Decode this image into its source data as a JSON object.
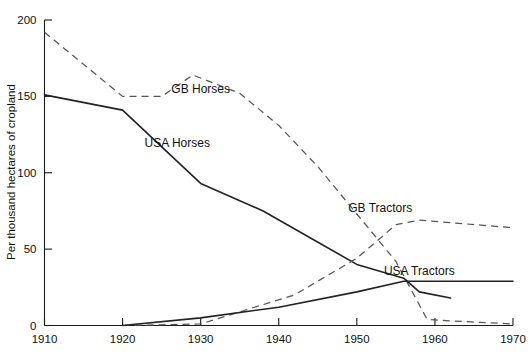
{
  "chart_data": {
    "type": "line",
    "title": "",
    "xlabel": "",
    "ylabel": "Per thousand hectares of cropland",
    "xlim": [
      1910,
      1970
    ],
    "ylim": [
      0,
      200
    ],
    "grid": false,
    "legend_position": "inline-annotations",
    "xticks": [
      1910,
      1920,
      1930,
      1940,
      1950,
      1960,
      1970
    ],
    "xticklabels": [
      "1910",
      "1920",
      "1930",
      "1940",
      "1950",
      "1960",
      "1970"
    ],
    "yticks": [
      0,
      50,
      100,
      150,
      200
    ],
    "yticklabels": [
      "0",
      "50",
      "100",
      "150",
      "200"
    ],
    "series": [
      {
        "name": "GB Horses",
        "style": "dashed",
        "label_x": 1930,
        "label_y": 152,
        "x": [
          1910,
          1920,
          1925,
          1929,
          1935,
          1940,
          1945,
          1950,
          1955,
          1959,
          1962,
          1970
        ],
        "values": [
          192,
          150,
          150,
          164,
          152,
          131,
          104,
          73,
          42,
          4,
          3,
          1
        ]
      },
      {
        "name": "USA Horses",
        "style": "solid",
        "label_x": 1927,
        "label_y": 117,
        "x": [
          1910,
          1920,
          1930,
          1938,
          1950,
          1956,
          1958,
          1962
        ],
        "values": [
          151,
          141,
          93,
          75,
          40,
          31,
          22,
          18
        ]
      },
      {
        "name": "GB Tractors",
        "style": "dashed",
        "label_x": 1953,
        "label_y": 74,
        "x": [
          1920,
          1930,
          1942,
          1950,
          1955,
          1958,
          1970
        ],
        "values": [
          0,
          1,
          20,
          44,
          66,
          69,
          64
        ]
      },
      {
        "name": "USA Tractors",
        "style": "solid",
        "label_x": 1958,
        "label_y": 33,
        "x": [
          1920,
          1930,
          1940,
          1950,
          1956,
          1962,
          1970
        ],
        "values": [
          0,
          5,
          12,
          22,
          29,
          29,
          29
        ]
      }
    ]
  },
  "axes": {
    "y_title": "Per thousand hectares of cropland"
  }
}
